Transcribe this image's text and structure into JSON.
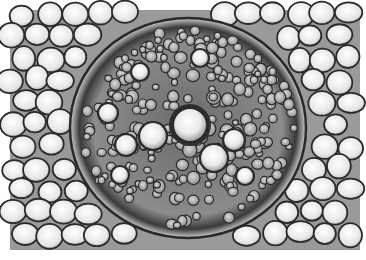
{
  "image": {
    "subject": "Plant root cross-section micrograph showing vascular cylinder",
    "colormode": "grayscale",
    "background": "#ffffff",
    "cell_wall_color": "#2a2a2a",
    "cell_fill_light": "#f2f2f2",
    "cell_fill_mid": "#bdbdbd",
    "cell_fill_dark": "#7a7a7a",
    "regions": {
      "cortex": "large pale rounded parenchyma cells surrounding the stele",
      "endodermis": "dark ring of small cells around the vascular cylinder",
      "stele": "central vascular cylinder with xylem vessels and phloem"
    },
    "central_vessel": {
      "cx": 190,
      "cy": 125,
      "r": 17
    },
    "large_vessels": [
      {
        "cx": 153,
        "cy": 136,
        "r": 14
      },
      {
        "cx": 214,
        "cy": 158,
        "r": 14
      },
      {
        "cx": 126,
        "cy": 145,
        "r": 11
      },
      {
        "cx": 234,
        "cy": 140,
        "r": 11
      },
      {
        "cx": 108,
        "cy": 113,
        "r": 10
      },
      {
        "cx": 140,
        "cy": 72,
        "r": 9
      },
      {
        "cx": 200,
        "cy": 58,
        "r": 9
      },
      {
        "cx": 120,
        "cy": 175,
        "r": 9
      },
      {
        "cx": 245,
        "cy": 176,
        "r": 9
      }
    ],
    "stele_ellipse": {
      "cx": 188,
      "cy": 128,
      "rx": 118,
      "ry": 110
    }
  }
}
